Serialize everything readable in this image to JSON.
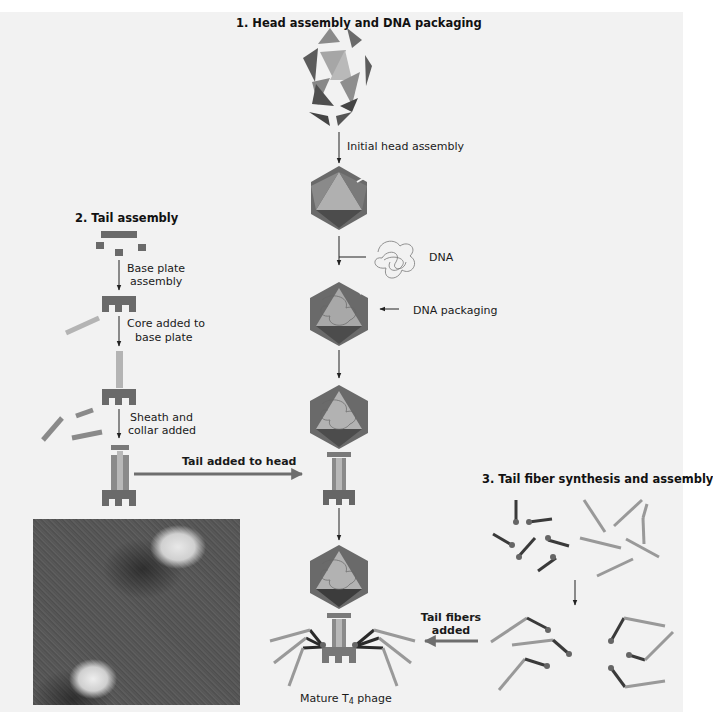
{
  "figure": {
    "step1_title": "1.  Head assembly and DNA packaging",
    "step2_title": "2.  Tail assembly",
    "step3_title": "3.  Tail fiber synthesis and assembly"
  },
  "labels": {
    "initial_head_assembly": "Initial head assembly",
    "dna": "DNA",
    "dna_packaging": "DNA packaging",
    "base_plate_line1": "Base plate",
    "base_plate_line2": "assembly",
    "core_line1": "Core added to",
    "core_line2": "base plate",
    "sheath_line1": "Sheath and",
    "sheath_line2": "collar added",
    "tail_added_to_head": "Tail added to head",
    "tail_fibers_line1": "Tail fibers",
    "tail_fibers_line2": "added",
    "mature_prefix": "Mature T",
    "mature_sub": "4",
    "mature_suffix": " phage"
  },
  "colors": {
    "panel_bg": "#f2f2f2",
    "dark_gray": "#5c5c5c",
    "mid_gray": "#8a8a8a",
    "light_gray": "#b4b4b4",
    "arrow": "#222222"
  }
}
